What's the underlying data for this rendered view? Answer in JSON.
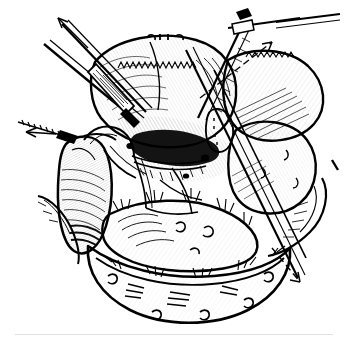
{
  "figure": {
    "kind": "surgical-anatomy-line-engraving",
    "title": "Operative exposure of the hepatobiliary hilum",
    "background_color": "#ffffff",
    "ink_color": "#000000",
    "rule_color": "#bcbcc0",
    "width": 350,
    "height": 348,
    "has_text_labels": false,
    "has_scale_bar": false,
    "has_border_frame": false
  },
  "rules": {
    "top": {
      "name": "top-hairline",
      "x": 12,
      "y": 2,
      "width": 120
    },
    "bottom": {
      "name": "bottom-hairline",
      "x": 15,
      "y": 334,
      "width": 318
    }
  },
  "structures": [
    {
      "id": "liver-left-lobe",
      "label": "Left hepatic lobe",
      "region": "upper-center-left"
    },
    {
      "id": "liver-right-lobe",
      "label": "Right hepatic lobe",
      "region": "upper-right"
    },
    {
      "id": "liver-inferior-lobe",
      "label": "Inferior hepatic margin",
      "region": "mid-right"
    },
    {
      "id": "gallbladder",
      "label": "Gallbladder",
      "region": "mid-left"
    },
    {
      "id": "cystic-duct",
      "label": "Cystic duct",
      "region": "center-left"
    },
    {
      "id": "hepatic-hilum",
      "label": "Porta hepatis / hilar dissection",
      "region": "center"
    },
    {
      "id": "duodenum",
      "label": "Duodenum",
      "region": "lower-center"
    },
    {
      "id": "transverse-colon",
      "label": "Transverse colon",
      "region": "lower"
    },
    {
      "id": "omentum",
      "label": "Greater omentum",
      "region": "bottom"
    },
    {
      "id": "mesentery-fold",
      "label": "Peritoneal fold",
      "region": "left-edge"
    }
  ],
  "instruments": [
    {
      "id": "retractor-upper-left",
      "label": "Upper left retractor blade",
      "orientation": "diagonal-down-right"
    },
    {
      "id": "retractor-upper-left-2",
      "label": "Second retractor shaft",
      "orientation": "diagonal-down-right"
    },
    {
      "id": "clamp-upper-right",
      "label": "Hemostatic clamp",
      "orientation": "diagonal-down-left"
    },
    {
      "id": "probe-center",
      "label": "Dissecting probe",
      "orientation": "diagonal-down-right"
    },
    {
      "id": "traction-band-left",
      "label": "Traction tape",
      "orientation": "horizontal-left"
    }
  ],
  "arrows": [
    {
      "id": "arrow-up-left",
      "label": "Retraction direction, cephalad-left",
      "direction": "up-left",
      "style": "solid"
    },
    {
      "id": "arrow-up-right",
      "label": "Retraction direction, cephalad-right",
      "direction": "up-right",
      "style": "dashed"
    },
    {
      "id": "arrow-left",
      "label": "Traction direction, lateral-left",
      "direction": "left",
      "style": "solid"
    },
    {
      "id": "arrow-down-right",
      "label": "Retraction direction, caudad-right",
      "direction": "down-right",
      "style": "dashed"
    }
  ]
}
